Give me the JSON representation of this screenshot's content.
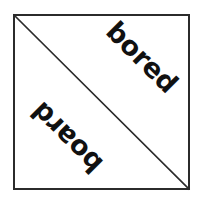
{
  "figure": {
    "background_color": "#ffffff",
    "box": {
      "name": "square-outline",
      "border_color": "#2b2b2b",
      "fill_color": "#ffffff",
      "border_width_px": 2
    },
    "diagonal": {
      "name": "diagonal-line",
      "color": "#2b2b2b",
      "width_px": 1.6,
      "from": "top-left",
      "to": "bottom-right"
    },
    "labels": [
      {
        "id": "bored",
        "text": "bored",
        "region": "upper-right-triangle",
        "rotation_deg": 45,
        "color": "#111111",
        "font_size_px": 27,
        "font_weight": "bold"
      },
      {
        "id": "board",
        "text": "board",
        "region": "lower-left-triangle",
        "rotation_deg": 225,
        "color": "#111111",
        "font_size_px": 27,
        "font_weight": "bold"
      }
    ]
  }
}
